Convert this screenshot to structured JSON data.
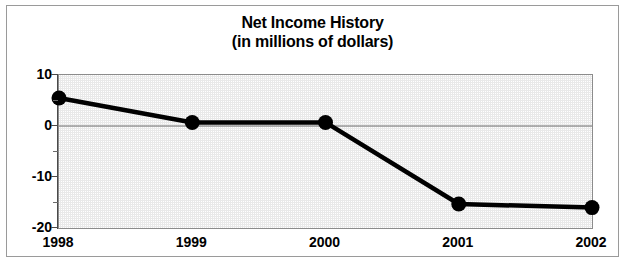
{
  "chart_data": {
    "type": "line",
    "title": "Net Income History",
    "subtitle": "(in millions of dollars)",
    "xlabel": "",
    "ylabel": "",
    "categories": [
      "1998",
      "1999",
      "2000",
      "2001",
      "2002"
    ],
    "values": [
      5.5,
      0.7,
      0.7,
      -15.3,
      -16.0
    ],
    "series": [
      {
        "name": "Net Income",
        "values": [
          5.5,
          0.7,
          0.7,
          -15.3,
          -16.0
        ]
      }
    ],
    "ylim": [
      -20,
      10
    ],
    "ytick_labels": [
      "10",
      "0",
      "-10",
      "-20"
    ],
    "ytick_values": [
      10,
      0,
      -10,
      -20
    ],
    "yminor_tick_values": [
      5,
      -5,
      -15
    ],
    "xtick_labels": [
      "1998",
      "1999",
      "2000",
      "2001",
      "2002"
    ],
    "grid": false,
    "legend": "none",
    "zero_line": true,
    "marker": "filled-circle",
    "line_color": "#000000",
    "marker_color": "#000000",
    "plot_background": "#e9e9e9",
    "frame_color": "#9a9a9a"
  },
  "title_lines": [
    {
      "text": "Net Income History"
    },
    {
      "text": "(in millions of dollars)"
    }
  ]
}
